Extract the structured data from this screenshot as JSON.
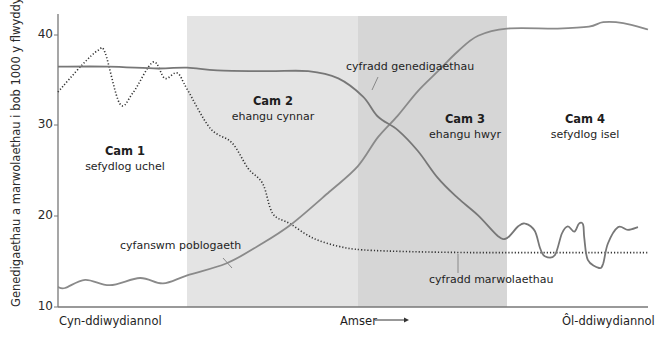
{
  "chart_data": {
    "type": "line",
    "title": "",
    "ylabel": "Genedigaethau a marwolaethau i bob 1000 y flwyddyn",
    "xlabel": "Amser",
    "ylim": [
      10,
      41
    ],
    "yticks": [
      10,
      20,
      30,
      40
    ],
    "xlim": [
      0,
      100
    ],
    "x_tick_labels": {
      "left": "Cyn-ddiwydiannol",
      "center": "Amser",
      "right": "Ôl-ddiwydiannol"
    },
    "grid": false,
    "stages": [
      {
        "title": "Cam 1",
        "subtitle": "sefydlog uchel",
        "x_start": 0,
        "x_end": 21.9,
        "shaded": false
      },
      {
        "title": "Cam 2",
        "subtitle": "ehangu cynnar",
        "x_start": 21.9,
        "x_end": 50.8,
        "shaded": true,
        "color": "#e3e3e3"
      },
      {
        "title": "Cam 3",
        "subtitle": "ehangu hwyr",
        "x_start": 50.8,
        "x_end": 76.1,
        "shaded": true,
        "color": "#d7d7d7"
      },
      {
        "title": "Cam 4",
        "subtitle": "sefydlog isel",
        "x_start": 76.1,
        "x_end": 100,
        "shaded": false
      }
    ],
    "series": [
      {
        "name": "cyfradd genedigaethau",
        "style": "solid",
        "color": "#7a7a7a",
        "x": [
          0,
          8.5,
          16.9,
          21.9,
          27,
          35.6,
          42.4,
          47.5,
          51.7,
          54.2,
          57.6,
          61,
          64.4,
          67.8,
          71.2,
          74.6,
          76.1,
          78,
          79.2,
          80.8,
          81.7,
          82.5,
          84.2,
          85.4,
          86.4,
          87.5,
          88.3,
          89,
          89.2,
          89.8,
          91.7,
          92.4,
          93.2,
          94.9,
          96.6,
          98.3
        ],
        "values": [
          36.5,
          36.5,
          36.3,
          36.4,
          36.1,
          36.0,
          36.0,
          35.2,
          33.2,
          31.0,
          29.5,
          27.2,
          24.2,
          22.0,
          20.1,
          17.8,
          17.6,
          18.9,
          19.2,
          18.4,
          16.5,
          15.6,
          15.7,
          18.1,
          18.9,
          18.3,
          19.2,
          19.1,
          17.6,
          15.2,
          14.3,
          14.8,
          17.0,
          18.8,
          18.5,
          18.8
        ]
      },
      {
        "name": "cyfradd marwolaethau",
        "style": "dotted",
        "color": "#333333",
        "x": [
          0,
          4.1,
          6.8,
          8.0,
          10.5,
          12.7,
          16.1,
          18.1,
          20.2,
          21.9,
          25.8,
          29.5,
          32.2,
          34.7,
          36.4,
          39.3,
          43.2,
          47.5,
          51.7,
          60,
          70,
          80,
          90,
          100
        ],
        "values": [
          33.7,
          36.7,
          38.3,
          38.0,
          32.4,
          33.6,
          37.0,
          35.2,
          35.8,
          34.0,
          29.7,
          28.1,
          25.3,
          23.6,
          20.3,
          19.2,
          17.6,
          16.7,
          16.3,
          16.1,
          16.0,
          16.0,
          16.0,
          16.0
        ]
      },
      {
        "name": "cyfanswm poblogaeth",
        "style": "solid",
        "color": "#8a8a8a",
        "x": [
          0,
          1.2,
          4.6,
          8.8,
          13.9,
          17.8,
          21.9,
          28.5,
          34.1,
          39.5,
          46.0,
          50.8,
          54.2,
          57.6,
          61.0,
          64.4,
          67.8,
          71.2,
          76.1,
          84.7,
          90.0,
          92.4,
          95.8,
          100
        ],
        "values": [
          12.2,
          12.1,
          13.0,
          12.4,
          13.2,
          12.6,
          13.5,
          14.8,
          16.8,
          19.1,
          22.7,
          25.5,
          28.7,
          31.1,
          33.8,
          36.0,
          38.2,
          39.9,
          40.7,
          40.7,
          40.9,
          41.4,
          41.3,
          40.6
        ]
      }
    ],
    "annotations": [
      {
        "text": "cyfradd genedigaethau",
        "target_series": "cyfradd genedigaethau"
      },
      {
        "text": "cyfradd marwolaethau",
        "target_series": "cyfradd marwolaethau"
      },
      {
        "text": "cyfanswm poblogaeth",
        "target_series": "cyfanswm poblogaeth"
      }
    ]
  },
  "labels": {
    "ylabel": "Genedigaethau a marwolaethau i bob 1000 y flwyddyn",
    "y40": "40",
    "y30": "30",
    "y20": "20",
    "y10": "10",
    "stage1_title": "Cam 1",
    "stage1_sub": "sefydlog uchel",
    "stage2_title": "Cam 2",
    "stage2_sub": "ehangu cynnar",
    "stage3_title": "Cam 3",
    "stage3_sub": "ehangu hwyr",
    "stage4_title": "Cam 4",
    "stage4_sub": "sefydlog isel",
    "birth_label": "cyfradd genedigaethau",
    "death_label": "cyfradd marwolaethau",
    "pop_label": "cyfanswm poblogaeth",
    "x_left": "Cyn-ddiwydiannol",
    "x_center": "Amser",
    "x_right": "Ôl-ddiwydiannol"
  }
}
